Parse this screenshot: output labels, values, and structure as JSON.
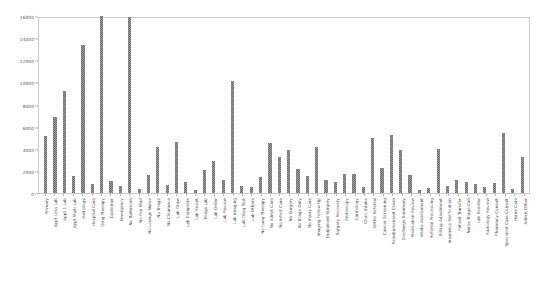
{
  "chart_data": {
    "type": "bar",
    "title": "",
    "xlabel": "",
    "ylabel": "",
    "ylim": [
      0,
      16000
    ],
    "grid": false,
    "legend": null,
    "ytick_labels": [
      "16000",
      "14000",
      "12000",
      "10000",
      "8000",
      "6000",
      "4000",
      "2000",
      "0"
    ],
    "ytick_values": [
      16000,
      14000,
      12000,
      10000,
      8000,
      6000,
      4000,
      2000,
      0
    ],
    "bar_color": "#6e6e6e",
    "frame_color": "#c8c8c8",
    "categories": [
      "Primary",
      "Appt Less Lab",
      "Appt 1 Lab",
      "Appt Multi Lab",
      "Radiology",
      "Hospital Care",
      "Drug Therapy",
      "Customer",
      "Emergency",
      "No Bathroom",
      "No Fee Stall",
      "No Lounge Nurse",
      "No Triage",
      "No Clearance",
      "Lab Draw",
      "Lab Complete",
      "Lab Result",
      "Triage Lab",
      "Lab Order",
      "Lab Review",
      "Lab Imaging",
      "Lab Drug Test",
      "Lab Others",
      "No Lung Therapy",
      "No Admit Care",
      "No Infect Care",
      "No Surgery",
      "No Triage Only",
      "No Injury Care",
      "Imaging Follow Up",
      "Outpatient Surgery",
      "Surgery Recovery",
      "Endoscopy",
      "Cardiology",
      "Clinic Intake",
      "Ortho Referral",
      "Cancer Screening",
      "Reimbursement Claim",
      "Discharge Summary",
      "Medication Review",
      "Intake Assessment",
      "Referral Processing",
      "Billing Adjustment",
      "Insurance Verification",
      "Patient Transfer",
      "Nurse Triage Call",
      "Lab Reorder",
      "Radiology Review",
      "Pharmacy Consult",
      "Specialist Care Consult",
      "Home Care",
      "Admin Other"
    ],
    "values": [
      5150,
      6850,
      9200,
      1500,
      13400,
      850,
      16000,
      1050,
      600,
      15900,
      350,
      1600,
      4200,
      700,
      4600,
      1000,
      250,
      2050,
      2900,
      1150,
      10100,
      600,
      500,
      1450,
      4500,
      3250,
      3900,
      2200,
      1500,
      4200,
      1200,
      1000,
      1700,
      1700,
      500,
      5000,
      2250,
      5200,
      3900,
      1600,
      250,
      450,
      4000,
      600,
      1200,
      1000,
      800,
      550,
      900,
      5400,
      350,
      3300
    ]
  }
}
